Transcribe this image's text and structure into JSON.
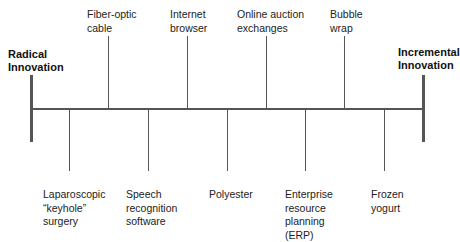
{
  "diagram": {
    "left_end_label": "Radical\nInnovation",
    "right_end_label": "Incremental\nInnovation",
    "line_color": "#555555",
    "items_above": [
      {
        "label": "Fiber-optic\ncable",
        "x": 108
      },
      {
        "label": "Internet\nbrowser",
        "x": 187
      },
      {
        "label": "Online auction\nexchanges",
        "x": 266
      },
      {
        "label": "Bubble\nwrap",
        "x": 344
      }
    ],
    "items_below": [
      {
        "label": "Laparoscopic\n“keyhole”\nsurgery",
        "x": 69
      },
      {
        "label": "Speech\nrecognition\nsoftware",
        "x": 148
      },
      {
        "label": "Polyester",
        "x": 227
      },
      {
        "label": "Enterprise\nresource\nplanning\n(ERP)",
        "x": 305
      },
      {
        "label": "Frozen\nyogurt",
        "x": 384
      }
    ],
    "order_left_to_right": [
      "Laparoscopic “keyhole” surgery",
      "Fiber-optic cable",
      "Speech recognition software",
      "Internet browser",
      "Polyester",
      "Online auction exchanges",
      "Enterprise resource planning (ERP)",
      "Bubble wrap",
      "Frozen yogurt"
    ]
  }
}
